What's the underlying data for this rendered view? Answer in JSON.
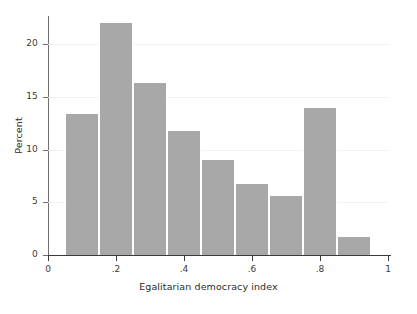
{
  "chart_data": {
    "type": "bar",
    "title": "",
    "subtitle": "",
    "xlabel": "Egalitarian democracy index",
    "ylabel": "Percent",
    "xlim": [
      0,
      1
    ],
    "ylim": [
      0,
      22.5
    ],
    "grid": true,
    "legend": null,
    "bin_width": 0.1,
    "bin_edges": [
      0.05,
      0.15,
      0.25,
      0.35,
      0.45,
      0.55,
      0.65,
      0.75,
      0.85,
      0.95
    ],
    "categories": [
      "0.05-0.15",
      "0.15-0.25",
      "0.25-0.35",
      "0.35-0.45",
      "0.45-0.55",
      "0.55-0.65",
      "0.65-0.75",
      "0.75-0.85",
      "0.85-0.95"
    ],
    "bin_centers": [
      0.1,
      0.2,
      0.3,
      0.4,
      0.5,
      0.6,
      0.7,
      0.8,
      0.9
    ],
    "values": [
      13.4,
      22.0,
      16.3,
      11.8,
      9.0,
      6.7,
      5.6,
      14.0,
      1.7
    ],
    "xticks": [
      0,
      0.2,
      0.4,
      0.6,
      0.8,
      1
    ],
    "xticklabels": [
      "0",
      ".2",
      ".4",
      ".6",
      ".8",
      "1"
    ],
    "yticks": [
      0,
      5,
      10,
      15,
      20
    ],
    "yticklabels": [
      "0",
      "5",
      "10",
      "15",
      "20"
    ],
    "bar_color": "#a8a8a8",
    "bar_edge_color": "#ffffff",
    "gridline_color": "#f2f2f2",
    "axis_color": "#3a3a3a",
    "background_color": "#ffffff"
  }
}
